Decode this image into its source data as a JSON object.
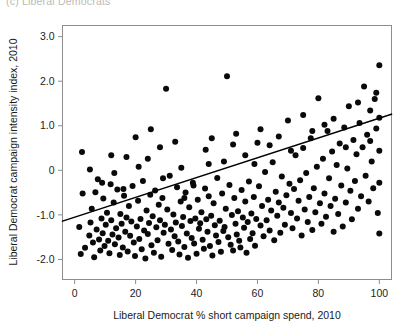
{
  "caption": {
    "text": "(c) Liberal Democrats"
  },
  "chart_data": {
    "type": "scatter",
    "title": "",
    "xlabel": "Liberal Democrat % short campaign spend, 2010",
    "ylabel": "Liberal Democrat campaign intensity index, 2010",
    "xlim": [
      -4,
      104
    ],
    "ylim": [
      -2.45,
      3.25
    ],
    "xticks": [
      0,
      20,
      40,
      60,
      80,
      100
    ],
    "xticklabels": [
      "0",
      "20",
      "40",
      "60",
      "80",
      "100"
    ],
    "yticks": [
      3.0,
      2.0,
      1.0,
      0,
      -1.0,
      -2.0
    ],
    "yticklabels": [
      "3.0",
      "2.0",
      "1.0",
      "0",
      "-1.0",
      "-2.0"
    ],
    "grid": false,
    "legend": null,
    "marker": {
      "shape": "circle",
      "color": "#0a0a0a",
      "size": 3.0
    },
    "fit_line": {
      "label": "linear fit",
      "color": "#000000",
      "x": [
        -4,
        104
      ],
      "y": [
        -1.14,
        1.26
      ]
    },
    "points": [
      [
        1.5,
        -1.27
      ],
      [
        2.0,
        -1.88
      ],
      [
        2.4,
        0.41
      ],
      [
        2.6,
        -0.52
      ],
      [
        3.4,
        -1.74
      ],
      [
        4.8,
        -1.46
      ],
      [
        5.2,
        -1.17
      ],
      [
        5.6,
        -0.86
      ],
      [
        6.0,
        -1.62
      ],
      [
        6.4,
        -1.95
      ],
      [
        6.8,
        -0.49
      ],
      [
        7.2,
        -1.33
      ],
      [
        7.6,
        -0.2
      ],
      [
        8.0,
        -1.55
      ],
      [
        8.4,
        -1.8
      ],
      [
        8.8,
        -1.08
      ],
      [
        9.2,
        -1.41
      ],
      [
        9.4,
        -0.63
      ],
      [
        9.8,
        -1.7
      ],
      [
        10.2,
        -1.22
      ],
      [
        10.6,
        -0.95
      ],
      [
        11.0,
        -1.58
      ],
      [
        11.4,
        -1.86
      ],
      [
        11.8,
        -0.31
      ],
      [
        12.0,
        -1.12
      ],
      [
        12.4,
        -1.44
      ],
      [
        12.8,
        -0.72
      ],
      [
        13.2,
        -1.66
      ],
      [
        13.6,
        -1.3
      ],
      [
        14.0,
        -0.43
      ],
      [
        14.4,
        -1.51
      ],
      [
        14.8,
        -1.9
      ],
      [
        15.0,
        -0.98
      ],
      [
        15.4,
        -1.2
      ],
      [
        15.8,
        -1.73
      ],
      [
        16.2,
        -0.57
      ],
      [
        16.6,
        -1.38
      ],
      [
        17.0,
        -1.06
      ],
      [
        17.4,
        -1.82
      ],
      [
        17.8,
        -0.8
      ],
      [
        18.2,
        -1.47
      ],
      [
        18.6,
        -1.15
      ],
      [
        19.0,
        -0.35
      ],
      [
        19.4,
        -1.62
      ],
      [
        19.8,
        -1.92
      ],
      [
        20.0,
        0.74
      ],
      [
        20.4,
        -1.26
      ],
      [
        20.8,
        -0.68
      ],
      [
        21.2,
        -1.54
      ],
      [
        21.6,
        -1.09
      ],
      [
        22.0,
        -1.77
      ],
      [
        22.4,
        -0.24
      ],
      [
        22.8,
        -1.35
      ],
      [
        23.2,
        -1.98
      ],
      [
        23.6,
        -0.9
      ],
      [
        24.0,
        -1.43
      ],
      [
        24.4,
        -1.18
      ],
      [
        24.8,
        -0.55
      ],
      [
        25.2,
        -1.68
      ],
      [
        25.6,
        -1.03
      ],
      [
        26.0,
        -1.85
      ],
      [
        26.4,
        -0.45
      ],
      [
        26.8,
        -1.28
      ],
      [
        27.2,
        -1.57
      ],
      [
        27.6,
        -0.77
      ],
      [
        28.0,
        -1.12
      ],
      [
        28.4,
        -1.94
      ],
      [
        28.8,
        -0.62
      ],
      [
        29.2,
        -1.4
      ],
      [
        29.6,
        -1.22
      ],
      [
        30.0,
        1.83
      ],
      [
        30.4,
        -0.88
      ],
      [
        30.8,
        -1.65
      ],
      [
        31.2,
        -0.12
      ],
      [
        31.6,
        -1.33
      ],
      [
        32.0,
        -1.79
      ],
      [
        32.4,
        -0.99
      ],
      [
        32.8,
        -1.48
      ],
      [
        33.2,
        -1.17
      ],
      [
        33.6,
        -0.38
      ],
      [
        34.0,
        -1.6
      ],
      [
        34.4,
        -1.89
      ],
      [
        34.8,
        -0.7
      ],
      [
        35.2,
        -1.25
      ],
      [
        35.6,
        -1.05
      ],
      [
        36.0,
        -1.72
      ],
      [
        36.4,
        -0.5
      ],
      [
        36.8,
        -1.42
      ],
      [
        37.2,
        -1.96
      ],
      [
        37.6,
        -0.83
      ],
      [
        38.0,
        -1.14
      ],
      [
        38.4,
        -1.52
      ],
      [
        38.8,
        -0.28
      ],
      [
        39.2,
        -1.64
      ],
      [
        39.6,
        -1.08
      ],
      [
        40.0,
        -1.87
      ],
      [
        40.4,
        -0.66
      ],
      [
        40.8,
        -1.31
      ],
      [
        41.2,
        -1.19
      ],
      [
        41.6,
        -0.94
      ],
      [
        42.0,
        -1.56
      ],
      [
        42.4,
        -1.76
      ],
      [
        42.8,
        -0.41
      ],
      [
        43.2,
        -1.1
      ],
      [
        43.6,
        -1.38
      ],
      [
        44.0,
        -0.58
      ],
      [
        44.4,
        -1.7
      ],
      [
        44.8,
        -1.02
      ],
      [
        45.2,
        -1.91
      ],
      [
        45.6,
        -0.74
      ],
      [
        46.0,
        -1.23
      ],
      [
        46.4,
        -1.46
      ],
      [
        46.8,
        -0.17
      ],
      [
        47.2,
        -1.61
      ],
      [
        47.6,
        -1.13
      ],
      [
        48.0,
        -1.83
      ],
      [
        48.4,
        -0.52
      ],
      [
        48.8,
        -1.36
      ],
      [
        49.2,
        -1.27
      ],
      [
        49.6,
        -0.86
      ],
      [
        50.0,
        2.11
      ],
      [
        50.4,
        -1.5
      ],
      [
        50.8,
        -0.33
      ],
      [
        51.2,
        -1.67
      ],
      [
        51.6,
        -1.0
      ],
      [
        52.0,
        -1.8
      ],
      [
        52.4,
        -0.62
      ],
      [
        52.8,
        -1.2
      ],
      [
        53.2,
        -1.44
      ],
      [
        53.6,
        -0.92
      ],
      [
        54.0,
        -1.58
      ],
      [
        54.4,
        -1.73
      ],
      [
        54.8,
        -0.44
      ],
      [
        55.2,
        -1.06
      ],
      [
        55.6,
        -1.29
      ],
      [
        56.0,
        -0.7
      ],
      [
        56.4,
        -1.85
      ],
      [
        56.8,
        -1.16
      ],
      [
        57.2,
        -0.25
      ],
      [
        57.6,
        -1.54
      ],
      [
        58.0,
        -0.97
      ],
      [
        58.4,
        -1.41
      ],
      [
        58.8,
        -0.6
      ],
      [
        59.2,
        -1.69
      ],
      [
        59.6,
        -1.09
      ],
      [
        60.0,
        0.62
      ],
      [
        60.5,
        -0.36
      ],
      [
        61.0,
        -1.24
      ],
      [
        61.5,
        -0.8
      ],
      [
        62.0,
        -1.48
      ],
      [
        62.5,
        -0.04
      ],
      [
        63.0,
        -1.12
      ],
      [
        63.5,
        -0.66
      ],
      [
        64.0,
        -1.35
      ],
      [
        64.5,
        -0.9
      ],
      [
        65.0,
        0.18
      ],
      [
        65.5,
        -1.57
      ],
      [
        66.0,
        -0.48
      ],
      [
        66.5,
        -1.02
      ],
      [
        67.0,
        -0.72
      ],
      [
        67.5,
        -1.4
      ],
      [
        68.0,
        -0.14
      ],
      [
        68.5,
        -0.84
      ],
      [
        69.0,
        -1.22
      ],
      [
        69.5,
        -0.56
      ],
      [
        70.0,
        1.12
      ],
      [
        70.5,
        -0.3
      ],
      [
        71.0,
        -0.96
      ],
      [
        71.5,
        -1.3
      ],
      [
        72.0,
        -0.42
      ],
      [
        72.5,
        0.34
      ],
      [
        73.0,
        -1.08
      ],
      [
        73.5,
        -0.68
      ],
      [
        74.0,
        -0.22
      ],
      [
        74.5,
        -1.46
      ],
      [
        75.0,
        0.5
      ],
      [
        75.5,
        -0.88
      ],
      [
        76.0,
        -0.06
      ],
      [
        76.5,
        -1.16
      ],
      [
        77.0,
        -0.6
      ],
      [
        77.5,
        0.72
      ],
      [
        78.0,
        -1.34
      ],
      [
        78.5,
        -0.4
      ],
      [
        79.0,
        -0.94
      ],
      [
        79.5,
        0.08
      ],
      [
        80.0,
        1.62
      ],
      [
        80.5,
        -0.74
      ],
      [
        81.0,
        -1.2
      ],
      [
        81.5,
        0.26
      ],
      [
        82.0,
        -0.52
      ],
      [
        82.5,
        -1.04
      ],
      [
        83.0,
        0.88
      ],
      [
        83.5,
        -0.18
      ],
      [
        84.0,
        -0.8
      ],
      [
        84.5,
        0.42
      ],
      [
        85.0,
        -1.38
      ],
      [
        85.5,
        -0.64
      ],
      [
        86.0,
        0.12
      ],
      [
        86.5,
        -0.98
      ],
      [
        87.0,
        0.6
      ],
      [
        87.5,
        -0.34
      ],
      [
        88.0,
        -1.26
      ],
      [
        88.5,
        0.96
      ],
      [
        89.0,
        -0.72
      ],
      [
        89.5,
        0.04
      ],
      [
        90.0,
        1.44
      ],
      [
        90.5,
        -0.46
      ],
      [
        91.0,
        -1.1
      ],
      [
        91.5,
        0.68
      ],
      [
        92.0,
        -0.24
      ],
      [
        92.5,
        0.36
      ],
      [
        93.0,
        -0.86
      ],
      [
        93.5,
        1.06
      ],
      [
        94.0,
        -0.58
      ],
      [
        94.5,
        0.52
      ],
      [
        95.0,
        1.88
      ],
      [
        95.5,
        -0.12
      ],
      [
        96.0,
        0.8
      ],
      [
        96.5,
        -0.7
      ],
      [
        97.0,
        1.34
      ],
      [
        97.5,
        0.2
      ],
      [
        98.0,
        -0.4
      ],
      [
        98.5,
        1.6
      ],
      [
        99.0,
        0.94
      ],
      [
        99.5,
        -0.96
      ],
      [
        100.0,
        2.36
      ],
      [
        100.0,
        1.18
      ],
      [
        100.0,
        0.44
      ],
      [
        100.0,
        -0.28
      ],
      [
        100.0,
        -1.42
      ],
      [
        25.0,
        0.92
      ],
      [
        43.0,
        0.46
      ],
      [
        49.0,
        0.2
      ],
      [
        56.0,
        0.34
      ],
      [
        64.0,
        0.56
      ],
      [
        35.0,
        0.06
      ],
      [
        29.0,
        -0.18
      ],
      [
        21.0,
        0.08
      ],
      [
        17.0,
        0.3
      ],
      [
        13.0,
        -0.06
      ],
      [
        5.0,
        0.02
      ],
      [
        9.0,
        -0.28
      ],
      [
        33.0,
        0.64
      ],
      [
        39.0,
        -0.34
      ],
      [
        45.0,
        0.72
      ],
      [
        53.0,
        0.82
      ],
      [
        59.0,
        0.14
      ],
      [
        67.0,
        0.76
      ],
      [
        71.0,
        0.44
      ],
      [
        75.0,
        1.24
      ],
      [
        85.0,
        1.16
      ],
      [
        89.0,
        0.52
      ],
      [
        93.0,
        1.52
      ],
      [
        97.0,
        0.66
      ],
      [
        99.0,
        1.74
      ],
      [
        12.0,
        0.34
      ],
      [
        16.0,
        -0.42
      ],
      [
        24.0,
        0.26
      ],
      [
        28.0,
        0.52
      ],
      [
        36.0,
        -0.62
      ],
      [
        44.0,
        0.14
      ],
      [
        52.0,
        0.58
      ],
      [
        61.0,
        0.92
      ],
      [
        78.0,
        0.88
      ],
      [
        82.0,
        1.02
      ]
    ]
  }
}
